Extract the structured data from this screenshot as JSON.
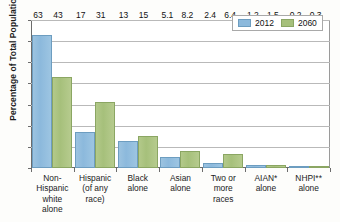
{
  "chart_data": {
    "type": "bar",
    "title": "",
    "xlabel": "",
    "ylabel": "Percentage of Total Population",
    "ylim": [
      0,
      70
    ],
    "ytick_values": [
      0,
      10,
      20,
      30,
      40,
      50,
      60,
      70
    ],
    "ytick_labels": [
      "0",
      "10",
      "20",
      "30",
      "40",
      "50",
      "60",
      "70"
    ],
    "grid": true,
    "legend_position": "top-right",
    "categories": [
      "Non-Hispanic white alone",
      "Hispanic (of any race)",
      "Black alone",
      "Asian alone",
      "Two or more races",
      "AIAN* alone",
      "NHPI** alone"
    ],
    "category_lines": [
      [
        "Non-",
        "Hispanic",
        "white",
        "alone"
      ],
      [
        "Hispanic",
        "(of any",
        "race)"
      ],
      [
        "Black",
        "alone"
      ],
      [
        "Asian",
        "alone"
      ],
      [
        "Two or",
        "more",
        "races"
      ],
      [
        "AIAN*",
        "alone"
      ],
      [
        "NHPI**",
        "alone"
      ]
    ],
    "series": [
      {
        "name": "2012",
        "color": "#8cb9dc",
        "values": [
          63,
          17,
          13,
          5.1,
          2.4,
          1.2,
          0.2
        ],
        "labels": [
          "63",
          "17",
          "13",
          "5.1",
          "2.4",
          "1.2",
          "0.2"
        ]
      },
      {
        "name": "2060",
        "color": "#a6c07b",
        "values": [
          43,
          31,
          15,
          8.2,
          6.4,
          1.5,
          0.3
        ],
        "labels": [
          "43",
          "31",
          "15",
          "8.2",
          "6.4",
          "1.5",
          "0.3"
        ]
      }
    ]
  },
  "legend": {
    "items": [
      {
        "label": "2012"
      },
      {
        "label": "2060"
      }
    ]
  }
}
